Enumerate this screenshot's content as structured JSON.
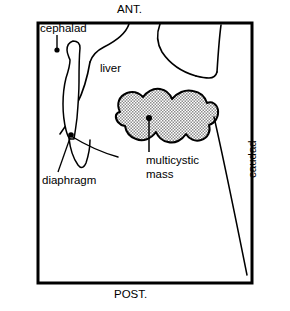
{
  "figure": {
    "kind": "ultrasound-schematic",
    "title_visible": false,
    "background_color": "#ffffff",
    "line_color": "#000000",
    "stipple_color": "#9a9a9a",
    "frame": {
      "left": 38,
      "top": 23,
      "right": 252,
      "bottom": 283,
      "border_color": "#000000",
      "border_width_px": 3
    },
    "orientation_labels": {
      "anterior": "ANT.",
      "posterior": "POST.",
      "caudad": "caudad"
    },
    "annotations": [
      {
        "id": "cephalad",
        "label": "cephalad",
        "has_leader": true,
        "leader_direction": "down",
        "marker": "dot"
      },
      {
        "id": "liver",
        "label": "liver",
        "has_leader": false,
        "leader_direction": "none",
        "marker": "none"
      },
      {
        "id": "diaphragm",
        "label": "diaphragm",
        "has_leader": true,
        "leader_direction": "up-right",
        "marker": "dot"
      },
      {
        "id": "multicystic-mass",
        "label": "multicystic mass",
        "label_line_1": "multicystic",
        "label_line_2": "mass",
        "has_leader": true,
        "leader_direction": "up",
        "marker": "dot"
      }
    ],
    "structures": [
      {
        "id": "liver",
        "fill": "none",
        "label": "liver"
      },
      {
        "id": "multicystic-mass",
        "fill": "stipple",
        "label": "multicystic mass"
      },
      {
        "id": "fluid-column",
        "fill": "none",
        "label": ""
      },
      {
        "id": "diaphragm-line",
        "fill": "none",
        "label": ""
      }
    ]
  },
  "icons": {
    "dot_marker": "dot-marker-icon"
  }
}
